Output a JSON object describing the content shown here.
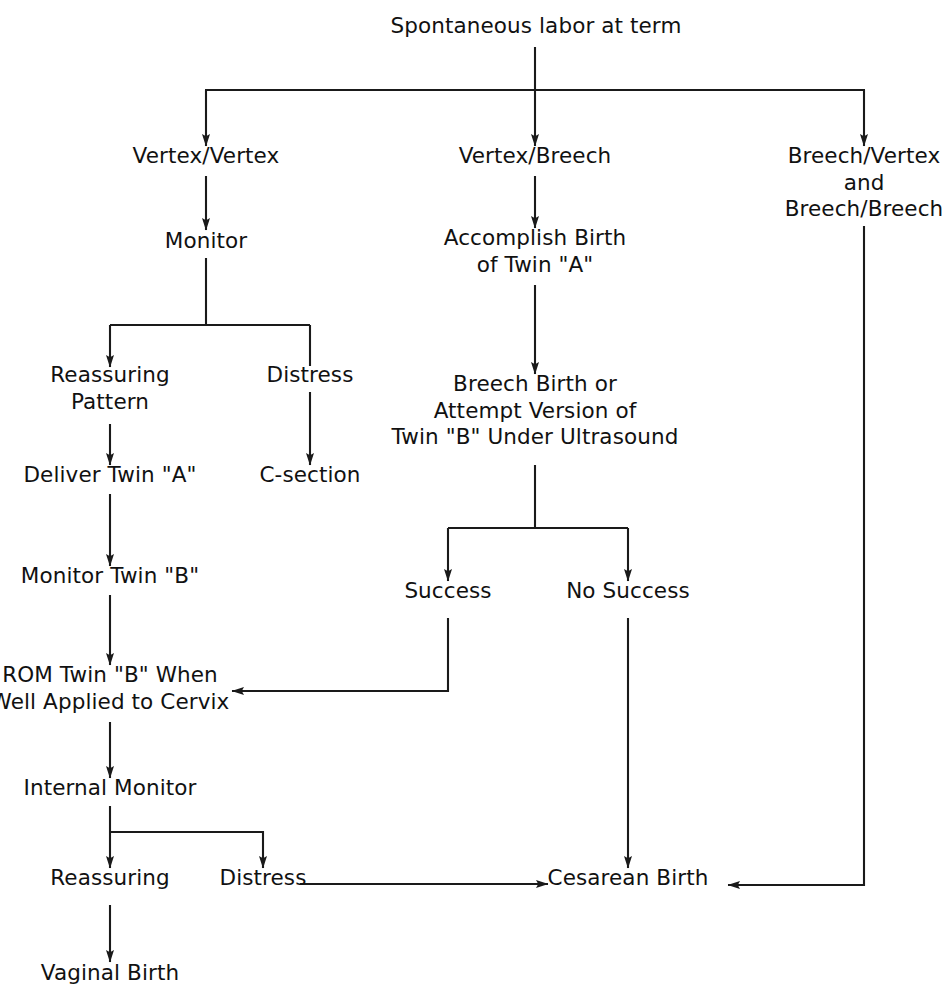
{
  "diagram": {
    "background_color": "#ffffff",
    "line_color": "#1a1a1a",
    "text_color": "#111111"
  },
  "nodes": {
    "root": "Spontaneous labor at term",
    "vertex_vertex": "Vertex/Vertex",
    "vertex_breech": "Vertex/Breech",
    "breech_vertex_and_breech_breech": "Breech/Vertex\nand\nBreech/Breech",
    "monitor": "Monitor",
    "accomplish_birth_twin_a": "Accomplish Birth\nof Twin \"A\"",
    "reassuring_pattern": "Reassuring\nPattern",
    "distress_upper": "Distress",
    "breech_birth_or_version": "Breech Birth or\nAttempt Version of\nTwin \"B\" Under Ultrasound",
    "deliver_twin_a": "Deliver Twin \"A\"",
    "c_section": "C-section",
    "monitor_twin_b": "Monitor Twin \"B\"",
    "success": "Success",
    "no_success": "No Success",
    "rom_twin_b": "ROM Twin \"B\" When\nWell Applied to Cervix",
    "internal_monitor": "Internal Monitor",
    "reassuring_lower": "Reassuring",
    "distress_lower": "Distress",
    "cesarean_birth": "Cesarean Birth",
    "vaginal_birth": "Vaginal Birth"
  },
  "edges": [
    {
      "from": "root",
      "to": "vertex_vertex",
      "kind": "elbow-down-left",
      "arrow": true
    },
    {
      "from": "root",
      "to": "vertex_breech",
      "kind": "straight-down",
      "arrow": true
    },
    {
      "from": "root",
      "to": "breech_vertex_and_breech_breech",
      "kind": "elbow-down-right",
      "arrow": true
    },
    {
      "from": "vertex_vertex",
      "to": "monitor",
      "kind": "straight-down",
      "arrow": true
    },
    {
      "from": "vertex_breech",
      "to": "accomplish_birth_twin_a",
      "kind": "straight-down",
      "arrow": true
    },
    {
      "from": "monitor",
      "to": "reassuring_pattern",
      "kind": "elbow-down-left",
      "arrow": true
    },
    {
      "from": "monitor",
      "to": "distress_upper",
      "kind": "elbow-down-right",
      "arrow": false
    },
    {
      "from": "reassuring_pattern",
      "to": "deliver_twin_a",
      "kind": "straight-down",
      "arrow": true
    },
    {
      "from": "distress_upper",
      "to": "c_section",
      "kind": "straight-down",
      "arrow": true
    },
    {
      "from": "accomplish_birth_twin_a",
      "to": "breech_birth_or_version",
      "kind": "straight-down",
      "arrow": true
    },
    {
      "from": "deliver_twin_a",
      "to": "monitor_twin_b",
      "kind": "straight-down",
      "arrow": true
    },
    {
      "from": "monitor_twin_b",
      "to": "rom_twin_b",
      "kind": "straight-down",
      "arrow": true
    },
    {
      "from": "breech_birth_or_version",
      "to": "success",
      "kind": "elbow-down-left",
      "arrow": true
    },
    {
      "from": "breech_birth_or_version",
      "to": "no_success",
      "kind": "elbow-down-right",
      "arrow": true
    },
    {
      "from": "success",
      "to": "rom_twin_b",
      "kind": "elbow-down-then-left",
      "arrow": true
    },
    {
      "from": "rom_twin_b",
      "to": "internal_monitor",
      "kind": "straight-down",
      "arrow": true
    },
    {
      "from": "internal_monitor",
      "to": "reassuring_lower",
      "kind": "straight-down",
      "arrow": true
    },
    {
      "from": "internal_monitor",
      "to": "distress_lower",
      "kind": "elbow-down-right",
      "arrow": true
    },
    {
      "from": "reassuring_lower",
      "to": "vaginal_birth",
      "kind": "straight-down",
      "arrow": true
    },
    {
      "from": "distress_lower",
      "to": "cesarean_birth",
      "kind": "straight-right",
      "arrow": true
    },
    {
      "from": "no_success",
      "to": "cesarean_birth",
      "kind": "straight-down",
      "arrow": true
    },
    {
      "from": "breech_vertex_and_breech_breech",
      "to": "cesarean_birth",
      "kind": "down-then-left",
      "arrow": true
    }
  ]
}
